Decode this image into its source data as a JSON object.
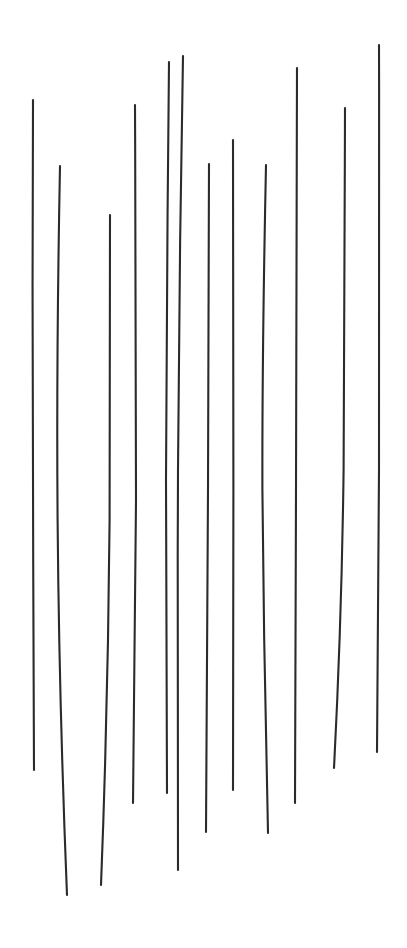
{
  "artwork": {
    "title": "Vertical Hand-Drawn Strokes",
    "medium_description": "Twelve slightly irregular near-vertical ink lines of varying length on a plain white ground",
    "canvas": {
      "width": 407,
      "height": 948,
      "background_color": "#ffffff"
    },
    "stroke_style": {
      "color": "#2b2b2d",
      "width_px": 2.1,
      "linecap": "round",
      "count": 12
    },
    "strokes": [
      {
        "id": 1,
        "label": "stroke-1",
        "top": {
          "x": 33,
          "y": 100
        },
        "bottom": {
          "x": 34,
          "y": 770
        },
        "length_px": 670,
        "path": "M33,100 C32.2,250 32.6,420 33.2,560 C33.6,660 33.9,720 34,770"
      },
      {
        "id": 2,
        "label": "stroke-2",
        "top": {
          "x": 60,
          "y": 166
        },
        "bottom": {
          "x": 67,
          "y": 895
        },
        "length_px": 729,
        "path": "M60,166 C57.4,300 56.8,420 57.6,520 C58.6,640 61.5,760 67,895"
      },
      {
        "id": 3,
        "label": "stroke-3",
        "top": {
          "x": 110,
          "y": 215
        },
        "bottom": {
          "x": 101,
          "y": 885
        },
        "length_px": 670,
        "path": "M110,215 C110.4,320 110.2,420 109.6,520 C108.6,640 105.5,770 101,885"
      },
      {
        "id": 4,
        "label": "stroke-4",
        "top": {
          "x": 135,
          "y": 105
        },
        "bottom": {
          "x": 133,
          "y": 803
        },
        "length_px": 698,
        "path": "M135,105 C135.6,250 136.2,400 136,500 C135.5,620 134.4,720 133,803"
      },
      {
        "id": 5,
        "label": "stroke-5",
        "top": {
          "x": 169,
          "y": 62
        },
        "bottom": {
          "x": 167,
          "y": 793
        },
        "length_px": 731,
        "path": "M169,62 C167.6,200 166.2,360 166,480 C166,600 166.4,710 167,793"
      },
      {
        "id": 6,
        "label": "stroke-6",
        "top": {
          "x": 183,
          "y": 56
        },
        "bottom": {
          "x": 178,
          "y": 870
        },
        "length_px": 814,
        "path": "M183,56 C180.6,190 178.6,340 178,470 C177.4,610 177.4,760 178,870"
      },
      {
        "id": 7,
        "label": "stroke-7",
        "top": {
          "x": 209,
          "y": 164
        },
        "bottom": {
          "x": 206,
          "y": 832
        },
        "length_px": 668,
        "path": "M209,164 C208.6,280 208.2,400 208,490 C207.6,620 206.8,740 206,832"
      },
      {
        "id": 8,
        "label": "stroke-8",
        "top": {
          "x": 233,
          "y": 140
        },
        "bottom": {
          "x": 233,
          "y": 790
        },
        "length_px": 650,
        "path": "M233,140 C233.4,270 233.6,390 233.4,490 C233.2,600 233,700 233,790"
      },
      {
        "id": 9,
        "label": "stroke-9",
        "top": {
          "x": 266,
          "y": 165
        },
        "bottom": {
          "x": 268,
          "y": 833
        },
        "length_px": 668,
        "path": "M266,165 C263.6,280 262.2,400 262.4,490 C263.2,600 265.6,730 268,833"
      },
      {
        "id": 10,
        "label": "stroke-10",
        "top": {
          "x": 297,
          "y": 68
        },
        "bottom": {
          "x": 295,
          "y": 803
        },
        "length_px": 735,
        "path": "M297,68 C296.6,220 296.2,380 296,490 C295.8,610 295.4,710 295,803"
      },
      {
        "id": 11,
        "label": "stroke-11",
        "top": {
          "x": 345,
          "y": 108
        },
        "bottom": {
          "x": 334,
          "y": 768
        },
        "length_px": 660,
        "path": "M345,108 C344.6,240 344.2,380 343.6,470 C342.2,580 338.6,680 334,768"
      },
      {
        "id": 12,
        "label": "stroke-12",
        "top": {
          "x": 379,
          "y": 45
        },
        "bottom": {
          "x": 377,
          "y": 752
        },
        "length_px": 707,
        "path": "M379,45 C379.4,200 379.4,360 379,470 C378.6,580 378,680 377,752"
      }
    ]
  }
}
